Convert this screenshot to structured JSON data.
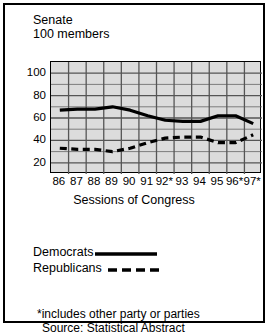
{
  "card": {
    "title_line1": "Senate",
    "title_line2": "100 members",
    "title_block": "Senate\n100 members"
  },
  "axis_title": "Sessions of Congress",
  "legend": {
    "democrats_label": "Democrats",
    "republicans_label": "Republicans",
    "democrats_style": "solid",
    "republicans_style": "dashed"
  },
  "notes": {
    "footnote": "*includes other party or parties",
    "source": "Source: Statistical Abstract"
  },
  "colors": {
    "plot_background": "#dcdcdc",
    "grid": "#555555",
    "line": "#000000",
    "border": "#000000",
    "page_background": "#ffffff"
  },
  "chart_data": {
    "type": "line",
    "title": "Senate 100 members",
    "xlabel": "Sessions of Congress",
    "ylabel": "",
    "categories": [
      "86",
      "87",
      "88",
      "89",
      "90",
      "91",
      "92*",
      "93",
      "94",
      "95",
      "96*",
      "97*"
    ],
    "x": [
      86,
      87,
      88,
      89,
      90,
      91,
      92,
      93,
      94,
      95,
      96,
      97
    ],
    "ylim": [
      10,
      110
    ],
    "yticks": [
      20,
      40,
      60,
      80,
      100
    ],
    "ytick_labels": [
      "20",
      "40",
      "60",
      "80",
      "100"
    ],
    "grid": true,
    "legend_position": "below-plot",
    "series": [
      {
        "name": "Democrats",
        "style": "solid",
        "values": [
          67,
          68,
          68,
          70,
          67,
          62,
          58,
          57,
          57,
          62,
          62,
          55
        ]
      },
      {
        "name": "Republicans",
        "style": "dashed",
        "values": [
          33,
          32,
          32,
          30,
          33,
          38,
          42,
          43,
          43,
          38,
          38,
          45
        ]
      }
    ]
  }
}
